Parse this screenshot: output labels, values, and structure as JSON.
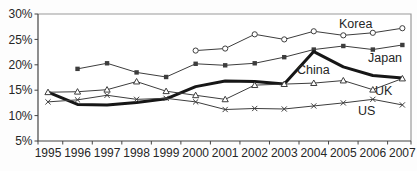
{
  "chart_data": {
    "type": "line",
    "title": "",
    "xlabel": "",
    "ylabel": "",
    "x": [
      1995,
      1996,
      1997,
      1998,
      1999,
      2000,
      2001,
      2002,
      2003,
      2004,
      2005,
      2006,
      2007
    ],
    "ylim": [
      5,
      30
    ],
    "yticks": [
      5,
      10,
      15,
      20,
      25,
      30
    ],
    "ytick_suffix": "%",
    "grid": "off",
    "frame": "box",
    "legend_position": "inline-labels",
    "series": [
      {
        "name": "Korea",
        "marker": "circle-open",
        "thick": false,
        "values": [
          null,
          null,
          null,
          null,
          null,
          22.8,
          23.2,
          26.0,
          25.0,
          26.6,
          25.8,
          26.3,
          27.2
        ]
      },
      {
        "name": "Japan",
        "marker": "square-filled",
        "thick": false,
        "values": [
          null,
          19.2,
          20.3,
          18.5,
          17.6,
          20.2,
          19.9,
          20.3,
          21.5,
          23.0,
          23.7,
          23.0,
          23.9
        ]
      },
      {
        "name": "China",
        "marker": "none",
        "thick": true,
        "values": [
          14.6,
          12.2,
          12.1,
          12.6,
          13.3,
          15.7,
          16.8,
          16.7,
          16.2,
          22.6,
          19.6,
          17.9,
          17.4
        ]
      },
      {
        "name": "UK",
        "marker": "triangle-open",
        "thick": false,
        "values": [
          14.6,
          14.7,
          15.1,
          16.7,
          14.8,
          14.0,
          13.2,
          16.0,
          16.2,
          16.4,
          16.9,
          15.1,
          17.3
        ]
      },
      {
        "name": "US",
        "marker": "x",
        "thick": false,
        "values": [
          12.7,
          13.1,
          14.0,
          13.2,
          13.4,
          12.7,
          11.2,
          11.4,
          11.3,
          11.9,
          12.5,
          13.2,
          12.1
        ]
      }
    ],
    "annotations": [
      {
        "text": "Korea",
        "x": 339,
        "y": 28
      },
      {
        "text": "Japan",
        "x": 368,
        "y": 62
      },
      {
        "text": "China",
        "x": 297,
        "y": 74
      },
      {
        "text": "UK",
        "x": 375,
        "y": 95
      },
      {
        "text": "US",
        "x": 358,
        "y": 115
      }
    ],
    "colors": {
      "line": "#3d3d3d",
      "thick_line": "#161616",
      "frame": "#9a9a9a",
      "axis": "#454545",
      "text": "#262626",
      "marker_fill_open": "#ffffff",
      "background": "#fdfdfd"
    }
  }
}
